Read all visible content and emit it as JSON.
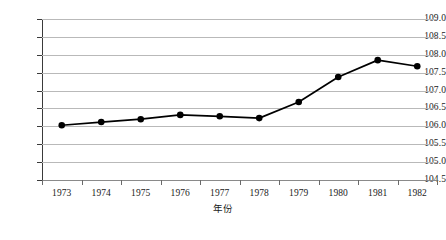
{
  "chart_data": {
    "type": "line",
    "title": "",
    "subtitle": "",
    "xlabel": "年份",
    "ylabel": "",
    "categories": [
      "1973",
      "1974",
      "1975",
      "1976",
      "1977",
      "1978",
      "1979",
      "1980",
      "1981",
      "1982"
    ],
    "values": [
      106.03,
      106.12,
      106.2,
      106.32,
      106.28,
      106.23,
      106.68,
      107.38,
      107.85,
      107.68
    ],
    "series": [
      {
        "name": "",
        "values": [
          106.03,
          106.12,
          106.2,
          106.32,
          106.28,
          106.23,
          106.68,
          107.38,
          107.85,
          107.68
        ]
      }
    ],
    "ylim": [
      104.5,
      109.0
    ],
    "ystep": 0.5,
    "ytick_labels": [
      "109.0",
      "108.5",
      "108.0",
      "107.5",
      "107.0",
      "106.5",
      "106.0",
      "105.5",
      "105.0",
      "104.5"
    ],
    "ytick_values": [
      109.0,
      108.5,
      108.0,
      107.5,
      107.0,
      106.5,
      106.0,
      105.5,
      105.0,
      104.5
    ],
    "xtick_labels": [
      "1973",
      "1974",
      "1975",
      "1976",
      "1977",
      "1978",
      "1979",
      "1980",
      "1981",
      "1982"
    ],
    "grid": true,
    "grid_axis": "y",
    "legend": false,
    "legend_position": "none",
    "marker": "circle",
    "line_color": "#000000",
    "marker_color": "#000000",
    "grid_color": "#b9b9b9",
    "axis_color": "#3a3a3a",
    "background_color": "#ffffff"
  }
}
